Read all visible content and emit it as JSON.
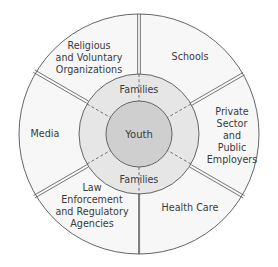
{
  "diagram": {
    "center": {
      "label": "Youth"
    },
    "middle_ring": {
      "top_label": "Families",
      "bottom_label": "Families"
    },
    "outer_sectors": [
      {
        "id": "religious",
        "lines": [
          "Religious",
          "and Voluntary",
          "Organizations"
        ]
      },
      {
        "id": "schools",
        "lines": [
          "Schools"
        ]
      },
      {
        "id": "private-sector",
        "lines": [
          "Private",
          "Sector",
          "and",
          "Public",
          "Employers"
        ]
      },
      {
        "id": "health-care",
        "lines": [
          "Health Care"
        ]
      },
      {
        "id": "law-enforcement",
        "lines": [
          "Law",
          "Enforcement",
          "and Regulatory",
          "Agencies"
        ]
      },
      {
        "id": "media",
        "lines": [
          "Media"
        ]
      }
    ],
    "colors": {
      "outer_fill": "#f7f7f7",
      "middle_fill": "#e6e6e6",
      "inner_fill": "#cfcfcf",
      "stroke": "#555555",
      "text": "#3a3a3a"
    }
  }
}
